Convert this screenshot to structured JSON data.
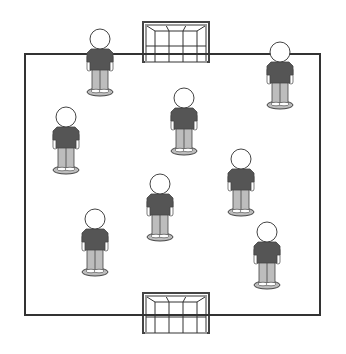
{
  "diagram": {
    "type": "soccer-field-formation",
    "field": {
      "x": 25,
      "y": 54,
      "width": 295,
      "height": 261,
      "line_color": "#333333"
    },
    "goals": [
      {
        "id": "top-goal",
        "cx": 176,
        "y": 22,
        "width": 66,
        "height": 40
      },
      {
        "id": "bottom-goal",
        "cx": 176,
        "y": 293,
        "width": 66,
        "height": 40
      }
    ],
    "colors": {
      "shirt": "#555555",
      "pants": "#bdbdbd",
      "head": "#ffffff",
      "base": "#bdbdbd",
      "outline": "#444444"
    },
    "players": [
      {
        "id": "player-1",
        "x": 100,
        "y": 37
      },
      {
        "id": "player-2",
        "x": 280,
        "y": 50
      },
      {
        "id": "player-3",
        "x": 66,
        "y": 115
      },
      {
        "id": "player-4",
        "x": 184,
        "y": 96
      },
      {
        "id": "player-5",
        "x": 241,
        "y": 157
      },
      {
        "id": "player-6",
        "x": 160,
        "y": 182
      },
      {
        "id": "player-7",
        "x": 95,
        "y": 217
      },
      {
        "id": "player-8",
        "x": 267,
        "y": 230
      }
    ]
  }
}
